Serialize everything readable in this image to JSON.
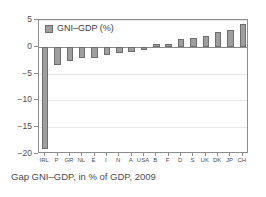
{
  "caption": "Gap GNI–GDP, in % of GDP, 2009",
  "legend": {
    "label": "GNI–GDP (%)"
  },
  "colors": {
    "bar_fill": "#9e9e9e",
    "bar_border": "#6e6e6e",
    "axis": "#8c8c8c",
    "grid": "#e8e8e8",
    "text": "#4d4d4d",
    "background": "#ffffff"
  },
  "chart_data": {
    "type": "bar",
    "title": "",
    "xlabel": "",
    "ylabel": "",
    "ylim": [
      -20,
      5
    ],
    "yticks": [
      5,
      0,
      -5,
      -10,
      -15,
      -20
    ],
    "ytick_labels": [
      "5",
      "0",
      "-5",
      "-10",
      "-15",
      "-20"
    ],
    "grid": true,
    "legend_position": "top-left",
    "series_name": "GNI–GDP (%)",
    "categories": [
      "IRL",
      "P",
      "GR",
      "NL",
      "E",
      "I",
      "N",
      "A",
      "USA",
      "B",
      "F",
      "D",
      "S",
      "UK",
      "DK",
      "JP",
      "CH"
    ],
    "values": [
      -19.0,
      -3.4,
      -2.6,
      -2.1,
      -2.0,
      -1.6,
      -1.2,
      -0.9,
      -0.6,
      0.6,
      0.6,
      1.4,
      1.7,
      2.0,
      2.8,
      3.1,
      4.3
    ]
  }
}
